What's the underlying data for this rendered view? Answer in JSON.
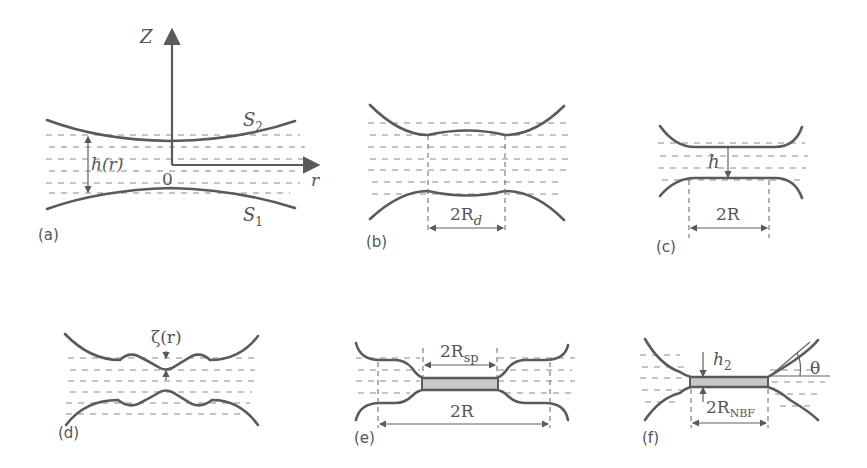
{
  "figure": {
    "panels": [
      {
        "id": "a",
        "label": "(a)",
        "annotations": {
          "axis_z": "Z",
          "axis_r": "r",
          "origin": "0",
          "thickness": "h(r)",
          "surface_top": "S",
          "surface_top_sub": "2",
          "surface_bottom": "S",
          "surface_bottom_sub": "1"
        }
      },
      {
        "id": "b",
        "label": "(b)",
        "annotations": {
          "dimension": "2R",
          "dimension_sub": "d"
        }
      },
      {
        "id": "c",
        "label": "(c)",
        "annotations": {
          "thickness": "h",
          "dimension": "2R"
        }
      },
      {
        "id": "d",
        "label": "(d)",
        "annotations": {
          "perturbation": "ζ(r)"
        }
      },
      {
        "id": "e",
        "label": "(e)",
        "annotations": {
          "inner_dimension": "2R",
          "inner_dimension_sub": "sp",
          "outer_dimension": "2R"
        }
      },
      {
        "id": "f",
        "label": "(f)",
        "annotations": {
          "thickness": "h",
          "thickness_sub": "2",
          "dimension": "2R",
          "dimension_sub": "NBF",
          "angle": "θ"
        }
      }
    ]
  },
  "colors": {
    "line": "#5a5a5a",
    "dashes": "#8a8a8a",
    "film_fill": "#c8c8c8",
    "text": "#555555"
  }
}
